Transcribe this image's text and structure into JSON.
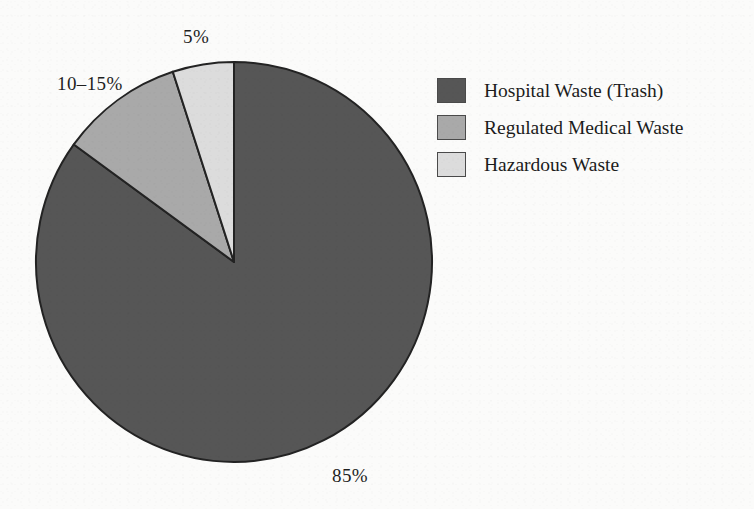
{
  "figure": {
    "background_color": "#fbfbfa",
    "ink_color": "#1c1c1c"
  },
  "chart_data": {
    "type": "pie",
    "title": "",
    "subtitle": "",
    "xlabel": "",
    "ylabel": "",
    "grid": false,
    "legend_position": "right",
    "start_angle_deg": 90,
    "direction": "clockwise",
    "categories": [
      "Hospital Waste (Trash)",
      "Regulated Medical Waste",
      "Hazardous Waste"
    ],
    "values": [
      85,
      10,
      5
    ],
    "data_labels": [
      "85%",
      "10–15%",
      "5%"
    ],
    "colors": [
      "#565656",
      "#a9a9a9",
      "#dcdcdc"
    ],
    "slice_edge_color": "#232323",
    "slices": [
      {
        "name": "Hospital Waste (Trash)",
        "value": 85,
        "label": "85%",
        "color": "#565656",
        "start_deg": 0,
        "sweep_deg": 306
      },
      {
        "name": "Regulated Medical Waste",
        "value": 10,
        "label": "10–15%",
        "color": "#a9a9a9",
        "start_deg": 306,
        "sweep_deg": 36
      },
      {
        "name": "Hazardous Waste",
        "value": 5,
        "label": "5%",
        "color": "#dcdcdc",
        "start_deg": 342,
        "sweep_deg": 18
      }
    ]
  },
  "labels": {
    "hospital_pct": "85%",
    "regulated_pct": "10–15%",
    "hazardous_pct": "5%"
  },
  "legend": {
    "items": [
      {
        "label": "Hospital Waste (Trash)",
        "color": "#565656"
      },
      {
        "label": "Regulated Medical Waste",
        "color": "#a9a9a9"
      },
      {
        "label": "Hazardous Waste",
        "color": "#dcdcdc"
      }
    ]
  }
}
